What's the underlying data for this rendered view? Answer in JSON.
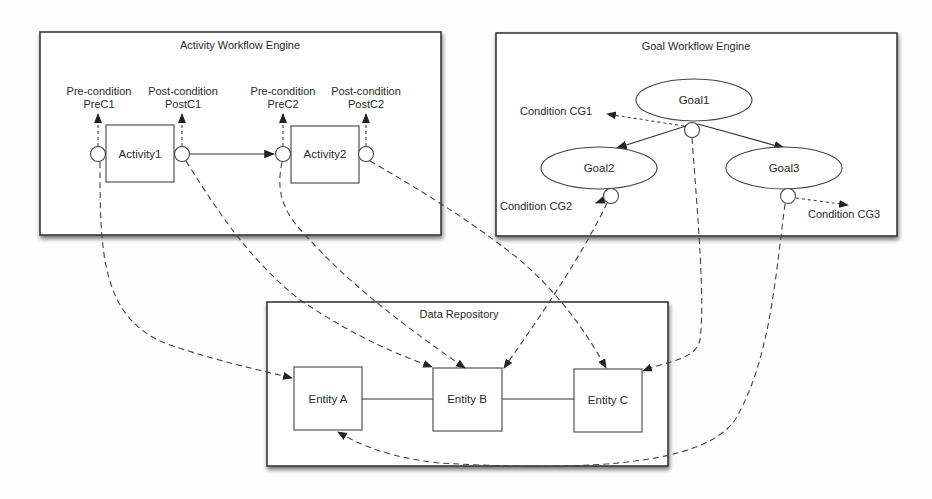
{
  "diagram": {
    "colors": {
      "frame": "#3a3a3a",
      "line": "#444444",
      "background": "#ffffff"
    },
    "containers": {
      "activity_engine": {
        "title": "Activity Workflow Engine"
      },
      "goal_engine": {
        "title": "Goal Workflow Engine"
      },
      "data_repository": {
        "title": "Data Repository"
      }
    },
    "activities": [
      {
        "label": "Activity1",
        "pre_condition": {
          "line1": "Pre-condition",
          "line2": "PreC1"
        },
        "post_condition": {
          "line1": "Post-condition",
          "line2": "PostC1"
        }
      },
      {
        "label": "Activity2",
        "pre_condition": {
          "line1": "Pre-condition",
          "line2": "PreC2"
        },
        "post_condition": {
          "line1": "Post-condition",
          "line2": "PostC2"
        }
      }
    ],
    "goals": [
      {
        "label": "Goal1",
        "condition": "Condition CG1"
      },
      {
        "label": "Goal2",
        "condition": "Condition CG2"
      },
      {
        "label": "Goal3",
        "condition": "Condition CG3"
      }
    ],
    "entities": [
      {
        "label": "Entity A"
      },
      {
        "label": "Entity B"
      },
      {
        "label": "Entity C"
      }
    ]
  }
}
